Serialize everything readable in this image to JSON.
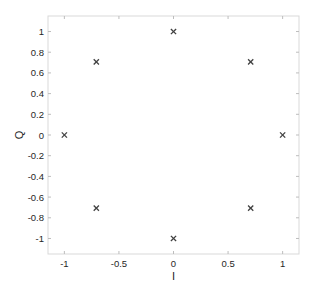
{
  "chart_data": {
    "type": "scatter",
    "title": "",
    "xlabel": "I",
    "ylabel": "Q",
    "xlim": [
      -1.15,
      1.15
    ],
    "ylim": [
      -1.15,
      1.15
    ],
    "xticks": [
      -1,
      -0.5,
      0,
      0.5,
      1
    ],
    "xtick_labels": [
      "-1",
      "-0.5",
      "0",
      "0.5",
      "1"
    ],
    "yticks": [
      -1,
      -0.8,
      -0.6,
      -0.4,
      -0.2,
      0,
      0.2,
      0.4,
      0.6,
      0.8,
      1
    ],
    "ytick_labels": [
      "-1",
      "-0.8",
      "-0.6",
      "-0.4",
      "-0.2",
      "0",
      "0.2",
      "0.4",
      "0.6",
      "0.8",
      "1"
    ],
    "grid": false,
    "marker": "x",
    "marker_color": "#404040",
    "axis_color": "#d9d9d9",
    "series": [
      {
        "name": "constellation",
        "points": [
          {
            "x": 1,
            "y": 0
          },
          {
            "x": 0.7071,
            "y": 0.7071
          },
          {
            "x": 0,
            "y": 1
          },
          {
            "x": -0.7071,
            "y": 0.7071
          },
          {
            "x": -1,
            "y": 0
          },
          {
            "x": -0.7071,
            "y": -0.7071
          },
          {
            "x": 0,
            "y": -1
          },
          {
            "x": 0.7071,
            "y": -0.7071
          }
        ]
      }
    ]
  }
}
